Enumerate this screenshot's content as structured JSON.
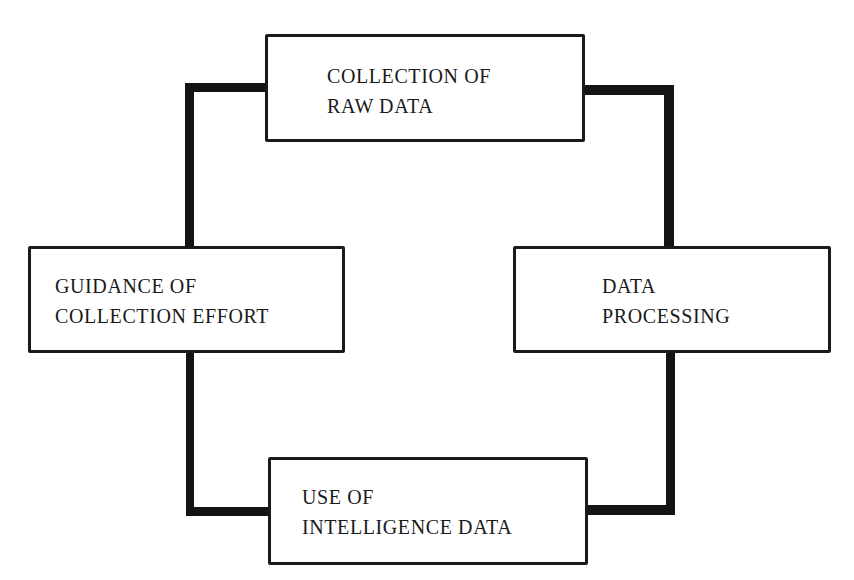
{
  "diagram": {
    "type": "cycle",
    "colors": {
      "line": "#141414",
      "box_border": "#1a1a1a",
      "text": "#1a1a1a",
      "background": "#ffffff"
    },
    "nodes": [
      {
        "id": "collection",
        "line1": "COLLECTION OF",
        "line2": "RAW DATA",
        "position": "top"
      },
      {
        "id": "processing",
        "line1": "DATA",
        "line2": "PROCESSING",
        "position": "right"
      },
      {
        "id": "use",
        "line1": "USE OF",
        "line2": "INTELLIGENCE DATA",
        "position": "bottom"
      },
      {
        "id": "guidance",
        "line1": "GUIDANCE OF",
        "line2": "COLLECTION EFFORT",
        "position": "left"
      }
    ],
    "connections": [
      {
        "from": "collection",
        "to": "processing"
      },
      {
        "from": "processing",
        "to": "use"
      },
      {
        "from": "use",
        "to": "guidance"
      },
      {
        "from": "guidance",
        "to": "collection"
      }
    ]
  }
}
